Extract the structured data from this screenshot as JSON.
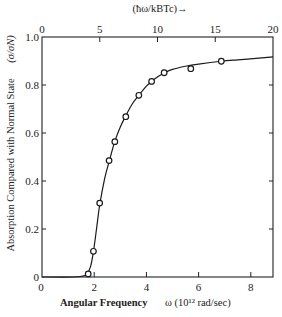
{
  "chart_data": {
    "type": "line",
    "title": "",
    "xlabel": "Angular Frequency",
    "xlabel_units": "ω (10¹² rad/sec)",
    "ylabel": "Absorption Compared with Normal State",
    "ylabel_units": "(σ/σN)",
    "top_xlabel": "(ħω/kBTc)→",
    "xlim": [
      0,
      8.85
    ],
    "ylim": [
      0,
      1.0
    ],
    "top_xlim": [
      0,
      20
    ],
    "x_ticks": [
      0,
      2,
      4,
      6,
      8
    ],
    "y_ticks": [
      0,
      0.2,
      0.4,
      0.6,
      0.8,
      1.0
    ],
    "y_tick_labels": [
      "0",
      "0.2",
      "0.4",
      "0.6",
      "0.8",
      "1.0"
    ],
    "top_x_ticks": [
      0,
      5,
      10,
      15,
      20
    ],
    "grid": false,
    "legend": null,
    "series": [
      {
        "name": "measured",
        "style": "open-circle-markers",
        "x": [
          1.77,
          1.97,
          2.21,
          2.57,
          2.79,
          3.21,
          3.71,
          4.2,
          4.68,
          5.7,
          6.87
        ],
        "y": [
          0.013,
          0.107,
          0.308,
          0.485,
          0.564,
          0.668,
          0.757,
          0.815,
          0.851,
          0.868,
          0.899
        ]
      },
      {
        "name": "theory curve",
        "style": "solid-line",
        "x": [
          0.0,
          1.2,
          1.5,
          1.7,
          1.85,
          1.97,
          2.1,
          2.21,
          2.4,
          2.57,
          2.79,
          3.0,
          3.21,
          3.45,
          3.71,
          4.0,
          4.2,
          4.45,
          4.68,
          5.0,
          5.5,
          6.0,
          6.87,
          7.5,
          8.2,
          8.85
        ],
        "y": [
          0.0,
          0.0,
          0.003,
          0.01,
          0.04,
          0.105,
          0.21,
          0.3,
          0.41,
          0.48,
          0.565,
          0.625,
          0.672,
          0.72,
          0.757,
          0.795,
          0.815,
          0.835,
          0.85,
          0.865,
          0.878,
          0.887,
          0.899,
          0.905,
          0.911,
          0.917
        ]
      }
    ]
  }
}
